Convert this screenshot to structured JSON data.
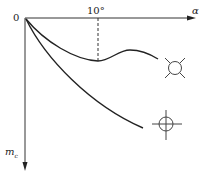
{
  "diagram": {
    "x_axis_label": "α",
    "y_axis_label_main": "m",
    "y_axis_label_sub": "c",
    "origin_label": "0",
    "tick_label": "10°",
    "curves": [
      {
        "name": "upper-curve",
        "symbol": "circle-with-diagonal-ticks",
        "description": "dips to minimum near 10°, then rises and falls"
      },
      {
        "name": "lower-curve",
        "symbol": "circle-with-crosshair",
        "description": "monotonically decreasing"
      }
    ],
    "colors": {
      "line": "#222222",
      "background": "#ffffff"
    }
  }
}
